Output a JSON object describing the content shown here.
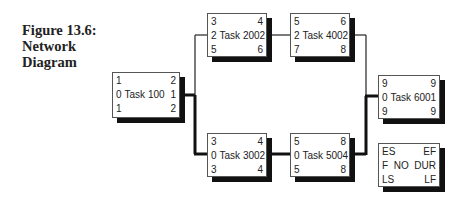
{
  "title": {
    "line1": "Figure 13.6:",
    "line2": "Network",
    "line3": "Diagram"
  },
  "nodes": [
    {
      "id": "task100",
      "name": "Task 100",
      "es": "1",
      "ef": "2",
      "float": "0",
      "dur": "1",
      "ls": "1",
      "lf": "2"
    },
    {
      "id": "task200",
      "name": "Task 200",
      "es": "3",
      "ef": "4",
      "float": "2",
      "dur": "2",
      "ls": "5",
      "lf": "6"
    },
    {
      "id": "task400",
      "name": "Task 400",
      "es": "5",
      "ef": "6",
      "float": "2",
      "dur": "2",
      "ls": "7",
      "lf": "8"
    },
    {
      "id": "task300",
      "name": "Task 300",
      "es": "3",
      "ef": "4",
      "float": "0",
      "dur": "2",
      "ls": "3",
      "lf": "4"
    },
    {
      "id": "task500",
      "name": "Task 500",
      "es": "5",
      "ef": "8",
      "float": "0",
      "dur": "4",
      "ls": "5",
      "lf": "8"
    },
    {
      "id": "task600",
      "name": "Task 600",
      "es": "9",
      "ef": "9",
      "float": "0",
      "dur": "1",
      "ls": "9",
      "lf": "9"
    }
  ],
  "legend": {
    "es": "ES",
    "ef": "EF",
    "float": "F",
    "name": "NO",
    "dur": "DUR",
    "ls": "LS",
    "lf": "LF"
  },
  "colors": {
    "critical_path": "#111111",
    "normal_path": "#333333",
    "shadow": "#111111"
  }
}
